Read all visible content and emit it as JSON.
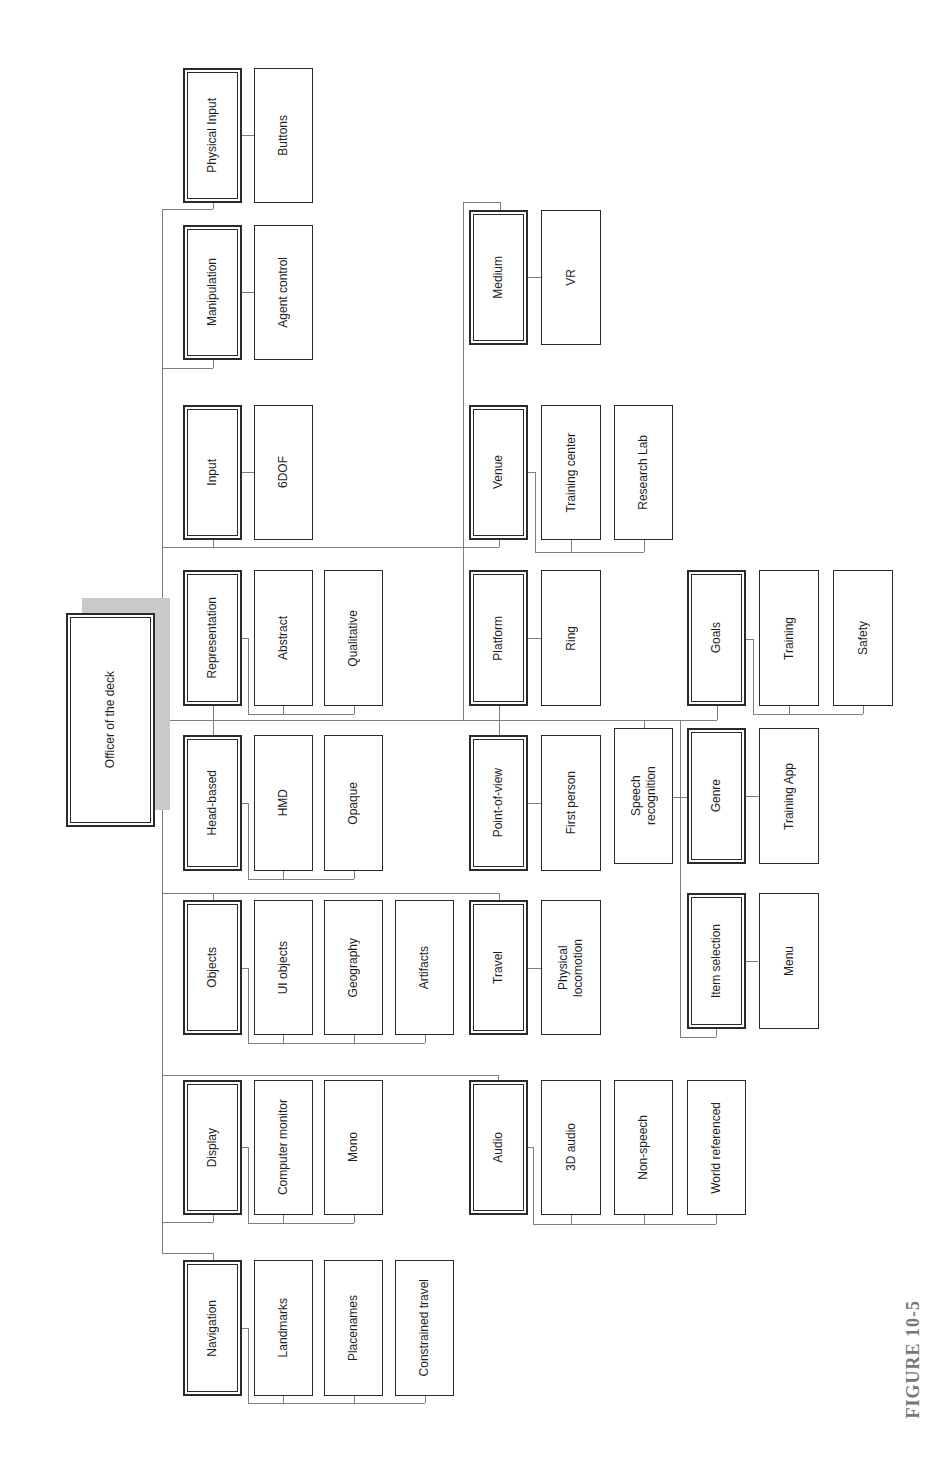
{
  "diagram": {
    "root": "Officer of the deck",
    "categories": [
      {
        "label": "Physical Input",
        "children": [
          "Buttons"
        ]
      },
      {
        "label": "Manipulation",
        "children": [
          "Agent control"
        ]
      },
      {
        "label": "Input",
        "children": [
          "6DOF"
        ]
      },
      {
        "label": "Representation",
        "children": [
          "Abstract",
          "Qualitative"
        ]
      },
      {
        "label": "Head-based",
        "children": [
          "HMD",
          "Opaque"
        ]
      },
      {
        "label": "Objects",
        "children": [
          "UI objects",
          "Geography",
          "Artifacts"
        ]
      },
      {
        "label": "Display",
        "children": [
          "Computer monitor",
          "Mono"
        ]
      },
      {
        "label": "Navigation",
        "children": [
          "Landmarks",
          "Placenames",
          "Constrained travel"
        ]
      },
      {
        "label": "Medium",
        "children": [
          "VR"
        ]
      },
      {
        "label": "Venue",
        "children": [
          "Training center",
          "Research Lab"
        ]
      },
      {
        "label": "Platform",
        "children": [
          "Ring"
        ]
      },
      {
        "label": "Point-of-view",
        "children": [
          "First person"
        ]
      },
      {
        "label": "Travel",
        "children": [
          "Physical locomotion"
        ]
      },
      {
        "label": "Audio",
        "children": [
          "3D audio",
          "Non-speech",
          "World referenced"
        ]
      },
      {
        "label": "Genre",
        "children": [
          "Training App"
        ]
      },
      {
        "label": "Goals",
        "children": [
          "Training",
          "Safety"
        ]
      },
      {
        "label": "Item selection",
        "children": [
          "Menu"
        ]
      }
    ],
    "standalone_nodes": [
      "Speech recognition"
    ]
  },
  "caption": {
    "figure_label": "FIGURE 10-5"
  },
  "colors": {
    "box_border": "#2a2a2a",
    "connector": "#7d7d7d",
    "root_shadow": "#c9c9c9",
    "caption": "#777777"
  }
}
